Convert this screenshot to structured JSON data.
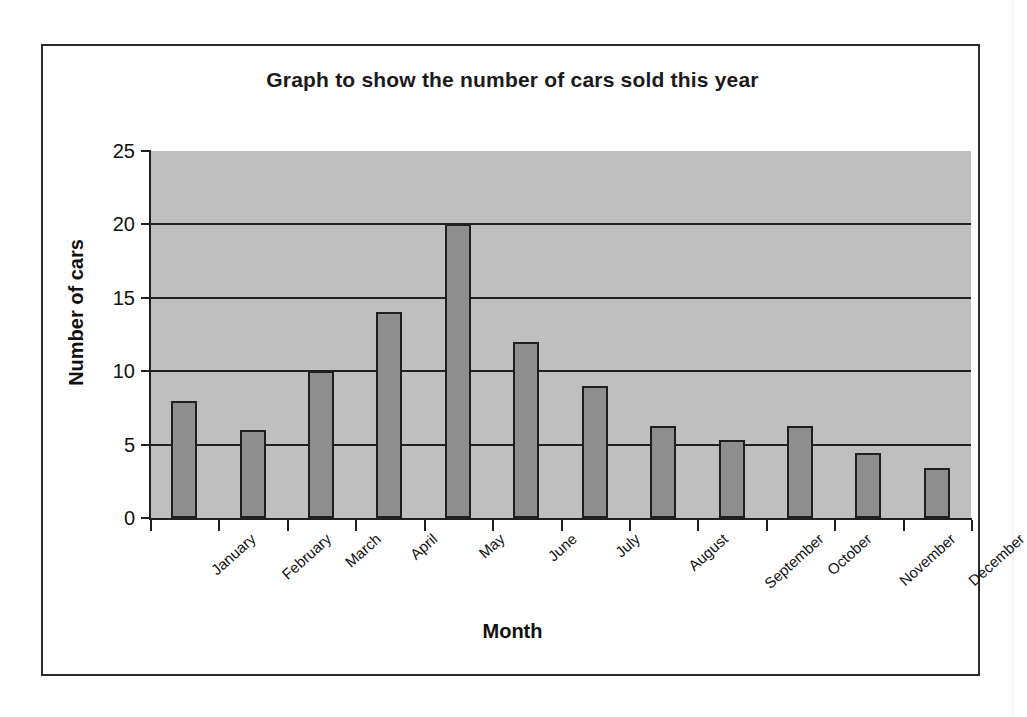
{
  "chart_data": {
    "type": "bar",
    "title": "Graph to show the number of cars sold this year",
    "xlabel": "Month",
    "ylabel": "Number of cars",
    "categories": [
      "January",
      "February",
      "March",
      "April",
      "May",
      "June",
      "July",
      "August",
      "September",
      "October",
      "November",
      "December"
    ],
    "values": [
      8,
      6,
      10,
      14,
      20,
      12,
      9,
      6.3,
      5.3,
      6.3,
      4.4,
      3.4
    ],
    "ylim": [
      0,
      25
    ],
    "yticks": [
      0,
      5,
      10,
      15,
      20,
      25
    ],
    "ytick_labels": [
      "0",
      "5",
      "10",
      "15",
      "20",
      "25"
    ],
    "grid": true,
    "grid_axis": "y",
    "legend": "none",
    "series": [
      {
        "name": "Number of cars",
        "values": [
          8,
          6,
          10,
          14,
          20,
          12,
          9,
          6.3,
          5.3,
          6.3,
          4.4,
          3.4
        ]
      }
    ],
    "colors": {
      "bar_fill": "#8e8e8e",
      "bar_border": "#1f1f1f",
      "plot_background": "#bfbfbf",
      "page_background": "#ffffff",
      "axis": "#1f1f1f",
      "text": "#111111"
    }
  }
}
